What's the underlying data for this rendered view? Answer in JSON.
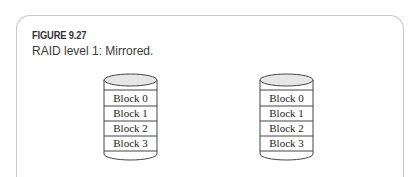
{
  "figure": {
    "label": "FIGURE 9.27",
    "caption": "RAID level 1: Mirrored."
  },
  "disks": [
    {
      "name": "disk-1",
      "blocks": [
        "Block 0",
        "Block 1",
        "Block 2",
        "Block 3"
      ]
    },
    {
      "name": "disk-2",
      "blocks": [
        "Block 0",
        "Block 1",
        "Block 2",
        "Block 3"
      ]
    }
  ]
}
